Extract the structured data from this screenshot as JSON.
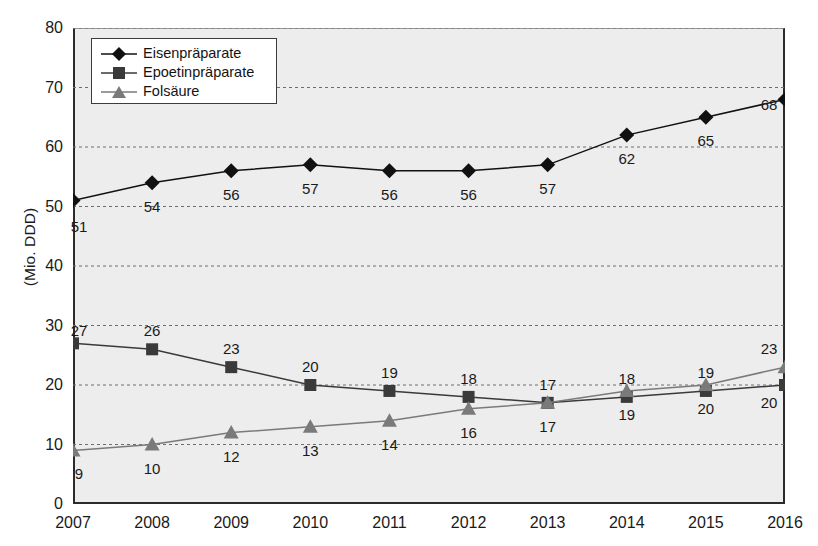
{
  "chart_data": {
    "type": "line",
    "title": "",
    "xlabel": "",
    "ylabel": "(Mio. DDD)",
    "categories": [
      "2007",
      "2008",
      "2009",
      "2010",
      "2011",
      "2012",
      "2013",
      "2014",
      "2015",
      "2016"
    ],
    "x": [
      2007,
      2008,
      2009,
      2010,
      2011,
      2012,
      2013,
      2014,
      2015,
      2016
    ],
    "ylim": [
      0,
      80
    ],
    "yticks": [
      0,
      10,
      20,
      30,
      40,
      50,
      60,
      70,
      80
    ],
    "grid": true,
    "legend_position": "top-left",
    "series": [
      {
        "name": "Eisenpräparate",
        "marker": "diamond",
        "color": "#111111",
        "label_position": "below",
        "values": [
          51,
          54,
          56,
          57,
          56,
          56,
          57,
          62,
          65,
          68
        ]
      },
      {
        "name": "Epoetinpräparate",
        "marker": "square",
        "color": "#3a3a3a",
        "label_position": "above",
        "values": [
          27,
          26,
          23,
          20,
          19,
          18,
          17,
          18,
          19,
          20
        ]
      },
      {
        "name": "Folsäure",
        "marker": "triangle",
        "color": "#7a7a7a",
        "label_position": "below",
        "values": [
          9,
          10,
          12,
          13,
          14,
          16,
          17,
          19,
          20,
          23
        ]
      }
    ]
  },
  "axis": {
    "y_label": "(Mio. DDD)",
    "y_ticks": [
      "0",
      "10",
      "20",
      "30",
      "40",
      "50",
      "60",
      "70",
      "80"
    ],
    "x_ticks": [
      "2007",
      "2008",
      "2009",
      "2010",
      "2011",
      "2012",
      "2013",
      "2014",
      "2015",
      "2016"
    ]
  },
  "legend": {
    "items": [
      {
        "label": "Eisenpräparate"
      },
      {
        "label": "Epoetinpräparate"
      },
      {
        "label": "Folsäure"
      }
    ]
  },
  "colors": {
    "plot_background": "#ededed",
    "axis": "#2b2b2b",
    "grid": "#6e6e6e",
    "series_1": "#111111",
    "series_2": "#3a3a3a",
    "series_3": "#7a7a7a"
  }
}
